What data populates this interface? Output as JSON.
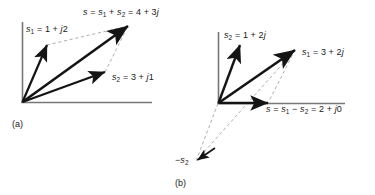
{
  "figure": {
    "type": "vector-diagram",
    "line_color": "#141414",
    "dashed_color": "#8a8a8a",
    "axis_color": "#6e6e6e",
    "background": "#ffffff",
    "panels": [
      {
        "id": "a",
        "caption": "(a)",
        "origin": [
          22,
          102
        ],
        "axes": {
          "y_top": 22,
          "x_right": 152
        },
        "labels": [
          {
            "name": "s1-label",
            "html": "<i>s</i><sub>1</sub> = 1 + <i>j</i>2",
            "x": 26,
            "y": 25
          },
          {
            "name": "sum-label",
            "html": "<i>s</i> = <i>s</i><sub>1</sub> + <i>s</i><sub>2</sub> = 4 + 3<i>j</i>",
            "x": 83,
            "y": 8
          },
          {
            "name": "s2-label",
            "html": "<i>s</i><sub>2</sub> = 3 + <i>j</i>1",
            "x": 112,
            "y": 73
          }
        ],
        "vectors": [
          {
            "name": "vector-s1",
            "label": "s1 = 1 + j2",
            "value": "1 + j2",
            "tip": [
              47,
              45
            ]
          },
          {
            "name": "vector-s2",
            "label": "s2 = 3 + j1",
            "value": "3 + j1",
            "tip": [
              105,
              72
            ]
          },
          {
            "name": "vector-sum",
            "label": "s = s1 + s2 = 4 + 3j",
            "value": "4 + 3j",
            "tip": [
              128,
              26
            ]
          }
        ]
      },
      {
        "id": "b",
        "caption": "(b)",
        "origin": [
          218,
          103
        ],
        "axes": {
          "y_top": 32,
          "x_right": 345
        },
        "labels": [
          {
            "name": "s2-label",
            "html": "<i>s</i><sub>2</sub> = 1 + 2<i>j</i>",
            "x": 224,
            "y": 31
          },
          {
            "name": "s1-label",
            "html": "<i>s</i><sub>1</sub> = 3 + 2<i>j</i>",
            "x": 302,
            "y": 48
          },
          {
            "name": "difference-label",
            "html": "<i>s</i> = <i>s</i><sub>1</sub> &minus; <i>s</i><sub>2</sub> = 2 + <i>j</i>0",
            "x": 266,
            "y": 105
          },
          {
            "name": "neg-s2-label",
            "html": "&minus;<i>s</i><sub>2</sub>",
            "x": 175,
            "y": 156
          }
        ],
        "vectors": [
          {
            "name": "vector-s2",
            "label": "s2 = 1 + 2j",
            "value": "1 + 2j",
            "tip": [
              240,
              45
            ]
          },
          {
            "name": "vector-s1",
            "label": "s1 = 3 + 2j",
            "value": "3 + 2j",
            "tip": [
              295,
              50
            ]
          },
          {
            "name": "vector-difference",
            "label": "s = s1 - s2 = 2 + j0",
            "value": "2 + j0",
            "tip": [
              268,
              103
            ]
          },
          {
            "name": "vector-neg-s2",
            "label": "-s2",
            "value": "-(1 + 2j)",
            "tip": [
              196,
              160
            ]
          }
        ]
      }
    ]
  }
}
